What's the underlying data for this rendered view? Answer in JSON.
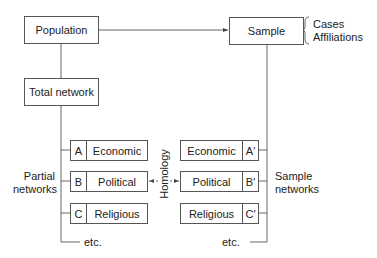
{
  "nodes": {
    "population": "Population",
    "sample": "Sample",
    "total_network": "Total network"
  },
  "sample_annotation": [
    "Cases",
    "Affiliations"
  ],
  "partial_networks": {
    "label_line1": "Partial",
    "label_line2": "networks",
    "items": [
      {
        "key": "A",
        "label": "Economic"
      },
      {
        "key": "B",
        "label": "Political"
      },
      {
        "key": "C",
        "label": "Religious"
      }
    ],
    "etc": "etc."
  },
  "sample_networks": {
    "label_line1": "Sample",
    "label_line2": "networks",
    "items": [
      {
        "key": "A′",
        "label": "Economic"
      },
      {
        "key": "B′",
        "label": "Political"
      },
      {
        "key": "C′",
        "label": "Religious"
      }
    ],
    "etc": "etc."
  },
  "homology_label": "Homology"
}
